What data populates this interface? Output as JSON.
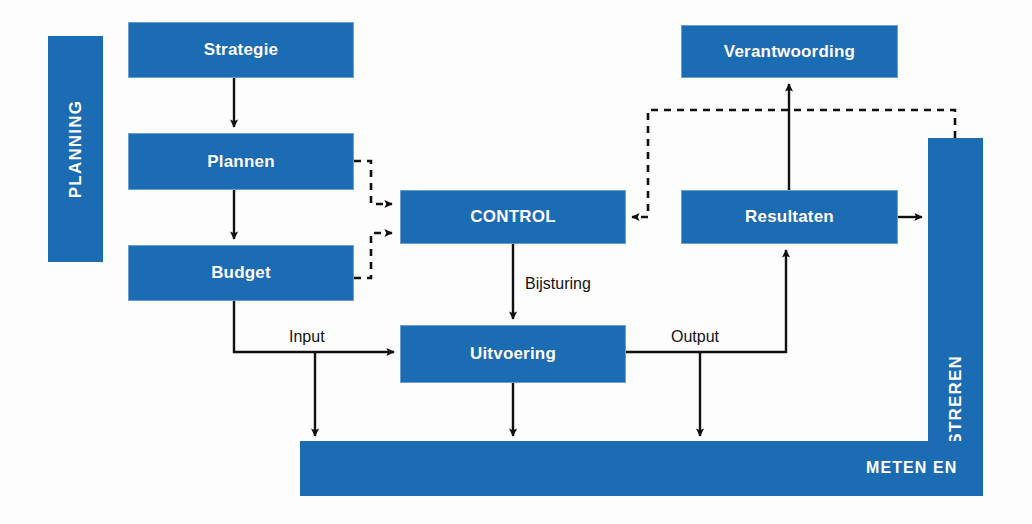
{
  "diagram": {
    "colors": {
      "block_blue": "#1c6cb4",
      "line_black": "#111111",
      "background": "#fdfdfd",
      "label_text": "#121212",
      "block_text": "#ffffff"
    },
    "bands": {
      "planning": "PLANNING",
      "registreren": "REGISTREREN",
      "meten_en": "METEN EN"
    },
    "boxes": {
      "strategie": "Strategie",
      "plannen": "Plannen",
      "budget": "Budget",
      "control": "CONTROL",
      "uitvoering": "Uitvoering",
      "resultaten": "Resultaten",
      "verantwoording": "Verantwoording"
    },
    "edge_labels": {
      "bijsturing": "Bijsturing",
      "input": "Input",
      "output": "Output"
    }
  }
}
